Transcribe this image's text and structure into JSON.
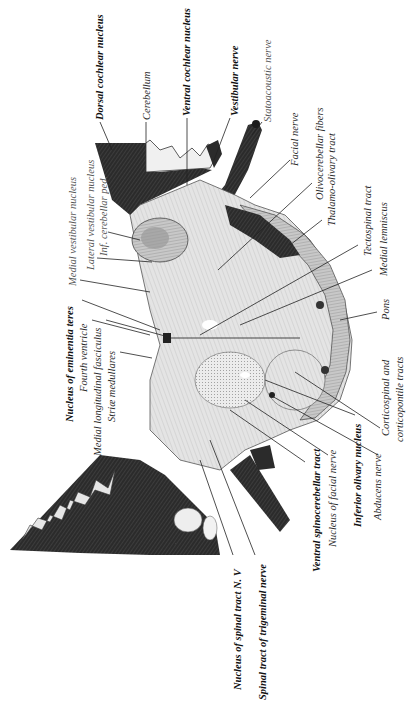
{
  "figure": {
    "type": "anatomical-cross-section",
    "orientation": "rotated 90 degrees counter-clockwise; labels read bottom-to-top",
    "colors": {
      "background": "#ffffff",
      "ink": "#1a1a1a",
      "tissue_light": "#d9d9d9",
      "tissue_mid": "#9a9a9a",
      "tissue_dark": "#2b2b2b"
    }
  },
  "labels": {
    "top": [
      {
        "id": "dorsal_cochlear_nucleus",
        "text": "Dorsal cochlear nucleus",
        "style": "bold"
      },
      {
        "id": "cerebellum",
        "text": "Cerebellum",
        "style": "normal"
      },
      {
        "id": "ventral_cochlear_nucleus",
        "text": "Ventral cochlear nucleus",
        "style": "bold"
      },
      {
        "id": "vestibular_nerve",
        "text": "Vestibular nerve",
        "style": "bold"
      },
      {
        "id": "statoacoustic_nerve",
        "text": "Statoacoustic nerve",
        "style": "light"
      }
    ],
    "right": [
      {
        "id": "facial_nerve",
        "text": "Facial nerve",
        "style": "normal"
      },
      {
        "id": "olivocerebellar_fibers",
        "text": "Olivocerebellar fibers",
        "style": "normal"
      },
      {
        "id": "thalamo_olivary_tract",
        "text": "Thalamo-olivary tract",
        "style": "normal"
      },
      {
        "id": "tectospinal_tract",
        "text": "Tectospinal tract",
        "style": "normal"
      },
      {
        "id": "medial_lemniscus",
        "text": "Medial lemniscus",
        "style": "normal"
      },
      {
        "id": "pons",
        "text": "Pons",
        "style": "normal"
      },
      {
        "id": "corticospinal_1",
        "text": "Corticospinal and",
        "style": "normal"
      },
      {
        "id": "corticospinal_2",
        "text": "corticopontile tracts",
        "style": "normal"
      }
    ],
    "bottom": [
      {
        "id": "abducens_nerve",
        "text": "Abducens nerve",
        "style": "normal"
      },
      {
        "id": "inferior_olivary_nucleus",
        "text": "Inferior olivary nucleus",
        "style": "bold"
      },
      {
        "id": "nucleus_facial_nerve",
        "text": "Nucleus of facial nerve",
        "style": "normal"
      },
      {
        "id": "ventral_spinocerebellar_tract",
        "text": "Ventral spinocerebellar tract",
        "style": "bold"
      },
      {
        "id": "spinal_tract_trigeminal",
        "text": "Spinal tract of trigeminal nerve",
        "style": "bold"
      },
      {
        "id": "nucleus_spinal_tract_nv",
        "text": "Nucleus of spinal tract N. V",
        "style": "bold"
      }
    ],
    "left": [
      {
        "id": "medial_vestibular_nucleus",
        "text": "Medial vestibular nucleus",
        "style": "light"
      },
      {
        "id": "lateral_vestibular_nucleus",
        "text": "Lateral vestibular nucleus",
        "style": "light"
      },
      {
        "id": "inf_cerebellar_ped",
        "text": "Inf. cerebellar ped.",
        "style": "light"
      },
      {
        "id": "nucleus_eminentia_teres",
        "text": "Nucleus of eminentia teres",
        "style": "bold"
      },
      {
        "id": "fourth_ventricle",
        "text": "Fourth ventricle",
        "style": "normal"
      },
      {
        "id": "medial_longitudinal_fasciculus",
        "text": "Medial longitudinal fasciculus",
        "style": "normal"
      },
      {
        "id": "striae_medullares",
        "text": "Striæ medullares",
        "style": "normal"
      }
    ]
  }
}
